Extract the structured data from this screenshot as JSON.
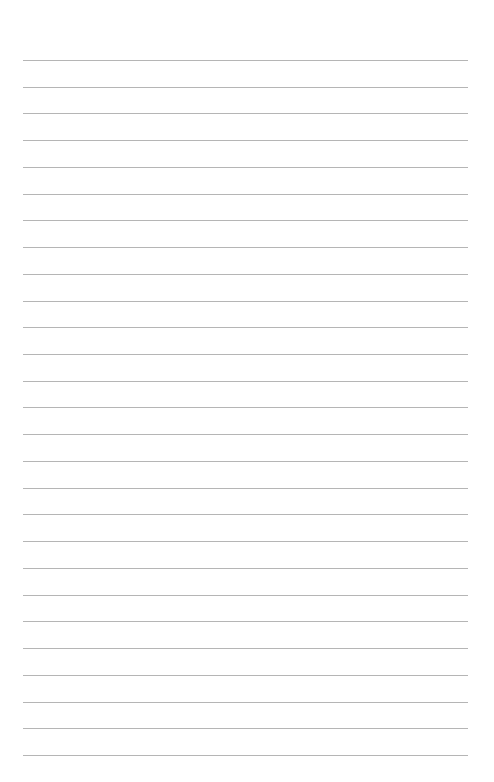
{
  "page": {
    "type": "lined-paper",
    "background_color": "#ffffff",
    "rule_color": "#a8a8a8",
    "rule_count": 27,
    "first_rule_y": 60,
    "rule_spacing": 26.73,
    "rule_left": 23,
    "rule_right": 468
  }
}
